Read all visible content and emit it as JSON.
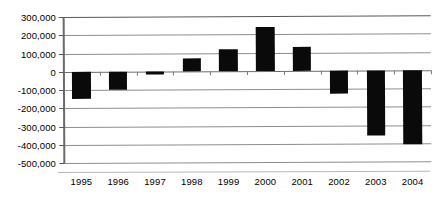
{
  "chart_data": {
    "type": "bar",
    "title": "",
    "subtitle": "",
    "xlabel": "",
    "ylabel": "",
    "categories": [
      "1995",
      "1996",
      "1997",
      "1998",
      "1999",
      "2000",
      "2001",
      "2002",
      "2003",
      "2004"
    ],
    "values": [
      -150000,
      -100000,
      -20000,
      70000,
      120000,
      240000,
      130000,
      -130000,
      -360000,
      -405000
    ],
    "series": [
      {
        "name": "",
        "values": [
          -150000,
          -100000,
          -20000,
          70000,
          120000,
          240000,
          130000,
          -130000,
          -360000,
          -405000
        ],
        "color": "#0a0a0a"
      }
    ],
    "ylim": [
      -500000,
      300000
    ],
    "ytick_values": [
      300000,
      200000,
      100000,
      0,
      -100000,
      -200000,
      -300000,
      -400000,
      -500000
    ],
    "ytick_labels": [
      "300,000",
      "200,000",
      "100,000",
      "0",
      "-100,000",
      "-200,000",
      "-300,000",
      "-400,000",
      "-500,000"
    ],
    "grid": true,
    "grid_axis": "y",
    "legend": false,
    "legend_position": "none",
    "bar_color": "#0a0a0a",
    "background_color": "#ffffff",
    "gridline_color": "#8d8d8d"
  }
}
